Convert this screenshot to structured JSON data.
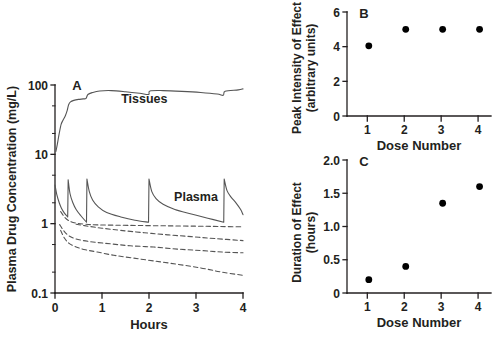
{
  "figure": {
    "background": "#ffffff",
    "ink": "#231f20",
    "curve_color": "#555555"
  },
  "chart_data": [
    {
      "type": "line",
      "panel": "A",
      "panel_label": "A",
      "title": "",
      "xlabel": "Hours",
      "ylabel": "Plasma Drug Concentration (mg/L)",
      "yscale": "log",
      "ylim": [
        0.1,
        100
      ],
      "ytick_labels": [
        "100",
        "10",
        "1",
        "0.1"
      ],
      "ytick_values": [
        100,
        10,
        1,
        0.1
      ],
      "xlim": [
        0,
        4
      ],
      "xtick_labels": [
        "0",
        "1",
        "2",
        "3",
        "4"
      ],
      "xtick_values": [
        0,
        1,
        2,
        3,
        4
      ],
      "grid": false,
      "legend_position": "inline-annotations",
      "annotations": [
        {
          "text": "Tissues",
          "x": 1.9,
          "y": 55
        },
        {
          "text": "Plasma",
          "x": 3.0,
          "y": 2.1
        }
      ],
      "dose_times": [
        0.0,
        0.28,
        0.68,
        2.0,
        3.6
      ],
      "series": [
        {
          "name": "Tissues",
          "style": "solid",
          "points": [
            [
              0.02,
              11
            ],
            [
              0.05,
              14
            ],
            [
              0.09,
              20
            ],
            [
              0.13,
              27
            ],
            [
              0.17,
              31
            ],
            [
              0.22,
              36
            ],
            [
              0.26,
              43
            ],
            [
              0.29,
              52
            ],
            [
              0.33,
              57
            ],
            [
              0.4,
              60
            ],
            [
              0.5,
              62
            ],
            [
              0.6,
              63
            ],
            [
              0.66,
              64
            ],
            [
              0.7,
              73
            ],
            [
              0.8,
              78
            ],
            [
              0.95,
              82
            ],
            [
              1.2,
              83
            ],
            [
              1.5,
              80
            ],
            [
              1.8,
              76
            ],
            [
              1.99,
              73
            ],
            [
              2.02,
              82
            ],
            [
              2.3,
              83
            ],
            [
              2.7,
              81
            ],
            [
              3.1,
              78
            ],
            [
              3.45,
              74
            ],
            [
              3.58,
              71
            ],
            [
              3.62,
              81
            ],
            [
              3.9,
              85
            ],
            [
              4.0,
              88
            ]
          ]
        },
        {
          "name": "Plasma",
          "style": "solid",
          "peak_values": [
            3.6,
            4.3,
            4.4,
            4.4,
            4.4
          ],
          "trough_values": [
            1.25,
            1.05,
            1.05,
            1.05,
            1.35
          ],
          "points": [
            [
              0.0,
              3.6
            ],
            [
              0.04,
              2.6
            ],
            [
              0.09,
              2.0
            ],
            [
              0.14,
              1.65
            ],
            [
              0.2,
              1.42
            ],
            [
              0.27,
              1.25
            ],
            [
              0.28,
              4.3
            ],
            [
              0.32,
              2.7
            ],
            [
              0.38,
              2.0
            ],
            [
              0.45,
              1.6
            ],
            [
              0.55,
              1.3
            ],
            [
              0.67,
              1.05
            ],
            [
              0.68,
              4.4
            ],
            [
              0.73,
              2.9
            ],
            [
              0.8,
              2.2
            ],
            [
              0.92,
              1.75
            ],
            [
              1.1,
              1.45
            ],
            [
              1.4,
              1.25
            ],
            [
              1.7,
              1.12
            ],
            [
              1.99,
              1.05
            ],
            [
              2.0,
              4.4
            ],
            [
              2.06,
              2.9
            ],
            [
              2.15,
              2.3
            ],
            [
              2.3,
              1.9
            ],
            [
              2.55,
              1.6
            ],
            [
              2.9,
              1.38
            ],
            [
              3.25,
              1.2
            ],
            [
              3.59,
              1.05
            ],
            [
              3.6,
              4.4
            ],
            [
              3.66,
              3.0
            ],
            [
              3.75,
              2.4
            ],
            [
              3.85,
              2.0
            ],
            [
              3.95,
              1.6
            ],
            [
              4.0,
              1.35
            ]
          ]
        },
        {
          "name": "Dashed curve 1",
          "style": "dashed",
          "points": [
            [
              0.12,
              1.5
            ],
            [
              0.2,
              1.25
            ],
            [
              0.3,
              1.1
            ],
            [
              0.45,
              1.02
            ],
            [
              0.65,
              0.98
            ],
            [
              0.9,
              0.96
            ],
            [
              1.3,
              0.95
            ],
            [
              1.8,
              0.94
            ],
            [
              2.4,
              0.93
            ],
            [
              3.0,
              0.92
            ],
            [
              3.5,
              0.91
            ],
            [
              4.0,
              0.9
            ]
          ]
        },
        {
          "name": "Dashed curve 2",
          "style": "dashed",
          "points": [
            [
              0.45,
              0.98
            ],
            [
              0.7,
              0.92
            ],
            [
              1.0,
              0.86
            ],
            [
              1.4,
              0.8
            ],
            [
              1.9,
              0.74
            ],
            [
              2.4,
              0.69
            ],
            [
              2.9,
              0.65
            ],
            [
              3.4,
              0.61
            ],
            [
              4.0,
              0.57
            ]
          ]
        },
        {
          "name": "Dashed curve 3",
          "style": "dashed",
          "points": [
            [
              0.1,
              0.97
            ],
            [
              0.18,
              0.8
            ],
            [
              0.28,
              0.68
            ],
            [
              0.42,
              0.61
            ],
            [
              0.6,
              0.57
            ],
            [
              0.85,
              0.54
            ],
            [
              1.2,
              0.51
            ],
            [
              1.6,
              0.48
            ],
            [
              2.1,
              0.46
            ],
            [
              2.6,
              0.43
            ],
            [
              3.1,
              0.41
            ],
            [
              3.55,
              0.39
            ],
            [
              4.0,
              0.38
            ]
          ]
        },
        {
          "name": "Dashed curve 4",
          "style": "dashed",
          "points": [
            [
              0.12,
              0.8
            ],
            [
              0.2,
              0.62
            ],
            [
              0.3,
              0.52
            ],
            [
              0.45,
              0.46
            ],
            [
              0.65,
              0.42
            ],
            [
              0.9,
              0.39
            ],
            [
              1.25,
              0.35
            ],
            [
              1.65,
              0.32
            ],
            [
              2.1,
              0.29
            ],
            [
              2.6,
              0.26
            ],
            [
              3.1,
              0.23
            ],
            [
              3.55,
              0.2
            ],
            [
              4.0,
              0.18
            ]
          ]
        }
      ]
    },
    {
      "type": "scatter",
      "panel": "B",
      "panel_label": "B",
      "title": "",
      "xlabel": "Dose Number",
      "ylabel": "Peak Intensity of Effect (arbitrary units)",
      "ylabel_line1": "Peak Intensity of Effect",
      "ylabel_line2": "(arbitrary units)",
      "ylim": [
        0,
        6
      ],
      "ytick_labels": [
        "0",
        "2",
        "4",
        "6"
      ],
      "ytick_values": [
        0,
        2,
        4,
        6
      ],
      "xlim": [
        0.45,
        4.35
      ],
      "xtick_labels": [
        "1",
        "2",
        "3",
        "4"
      ],
      "xtick_values": [
        1,
        2,
        3,
        4
      ],
      "grid": false,
      "marker": "filled-circle",
      "categories": [
        1,
        2,
        3,
        4
      ],
      "values": [
        4.05,
        5.0,
        5.0,
        5.0
      ]
    },
    {
      "type": "scatter",
      "panel": "C",
      "panel_label": "C",
      "title": "",
      "xlabel": "Dose Number",
      "ylabel": "Duration of Effect (hours)",
      "ylabel_line1": "Duration of Effect",
      "ylabel_line2": "(hours)",
      "ylim": [
        0,
        2.0
      ],
      "ytick_labels": [
        "0",
        "0.5",
        "1.0",
        "1.5",
        "2.0"
      ],
      "ytick_values": [
        0,
        0.5,
        1.0,
        1.5,
        2.0
      ],
      "xlim": [
        0.45,
        4.35
      ],
      "xtick_labels": [
        "1",
        "2",
        "3",
        "4"
      ],
      "xtick_values": [
        1,
        2,
        3,
        4
      ],
      "grid": false,
      "marker": "filled-circle",
      "categories": [
        1,
        2,
        3,
        4
      ],
      "values": [
        0.2,
        0.4,
        1.35,
        1.6
      ]
    }
  ]
}
